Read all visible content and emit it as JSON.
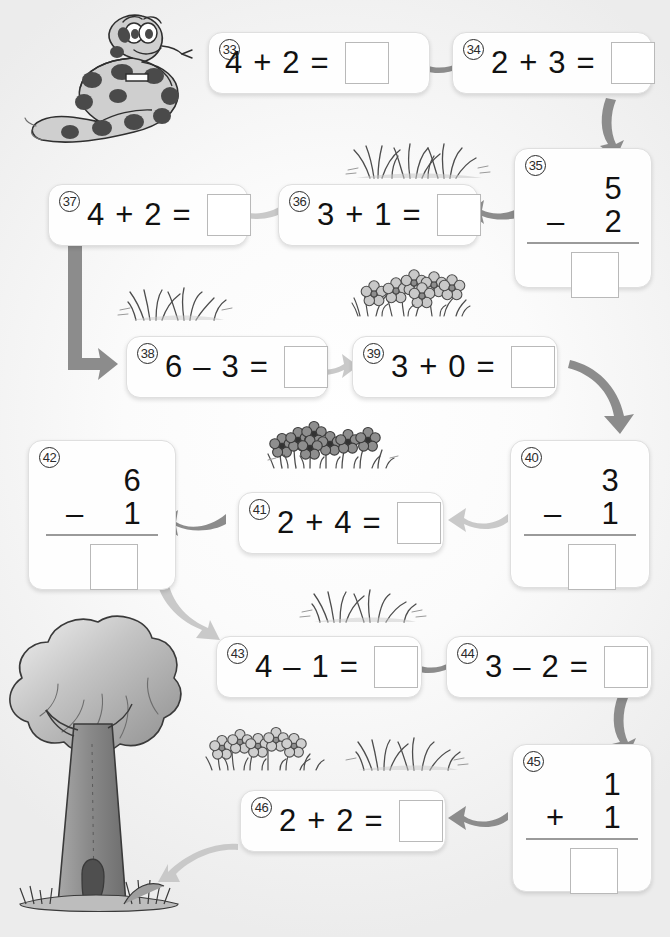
{
  "page": {
    "background_color": "#f4f4f4",
    "accent_color": "#8c8c8c"
  },
  "problems": [
    {
      "id": "33",
      "number": "33",
      "layout": "horizontal",
      "left": "4",
      "operator": "+",
      "right": "2",
      "equals": "=",
      "answer": ""
    },
    {
      "id": "34",
      "number": "34",
      "layout": "horizontal",
      "left": "2",
      "operator": "+",
      "right": "3",
      "equals": "=",
      "answer": ""
    },
    {
      "id": "35",
      "number": "35",
      "layout": "vertical",
      "top": "5",
      "operator": "–",
      "bottom": "2",
      "answer": ""
    },
    {
      "id": "36",
      "number": "36",
      "layout": "horizontal",
      "left": "3",
      "operator": "+",
      "right": "1",
      "equals": "=",
      "answer": ""
    },
    {
      "id": "37",
      "number": "37",
      "layout": "horizontal",
      "left": "4",
      "operator": "+",
      "right": "2",
      "equals": "=",
      "answer": ""
    },
    {
      "id": "38",
      "number": "38",
      "layout": "horizontal",
      "left": "6",
      "operator": "–",
      "right": "3",
      "equals": "=",
      "answer": ""
    },
    {
      "id": "39",
      "number": "39",
      "layout": "horizontal",
      "left": "3",
      "operator": "+",
      "right": "0",
      "equals": "=",
      "answer": ""
    },
    {
      "id": "40",
      "number": "40",
      "layout": "vertical",
      "top": "3",
      "operator": "–",
      "bottom": "1",
      "answer": ""
    },
    {
      "id": "41",
      "number": "41",
      "layout": "horizontal",
      "left": "2",
      "operator": "+",
      "right": "4",
      "equals": "=",
      "answer": ""
    },
    {
      "id": "42",
      "number": "42",
      "layout": "vertical",
      "top": "6",
      "operator": "–",
      "bottom": "1",
      "answer": ""
    },
    {
      "id": "43",
      "number": "43",
      "layout": "horizontal",
      "left": "4",
      "operator": "–",
      "right": "1",
      "equals": "=",
      "answer": ""
    },
    {
      "id": "44",
      "number": "44",
      "layout": "horizontal",
      "left": "3",
      "operator": "–",
      "right": "2",
      "equals": "=",
      "answer": ""
    },
    {
      "id": "45",
      "number": "45",
      "layout": "vertical",
      "top": "1",
      "operator": "+",
      "bottom": "1",
      "answer": ""
    },
    {
      "id": "46",
      "number": "46",
      "layout": "horizontal",
      "left": "2",
      "operator": "+",
      "right": "2",
      "equals": "=",
      "answer": ""
    }
  ],
  "decorations": [
    {
      "name": "snake-illustration",
      "kind": "snake"
    },
    {
      "name": "tree-illustration",
      "kind": "tree"
    },
    {
      "name": "grass-cluster-top",
      "kind": "grass"
    },
    {
      "name": "flower-cluster-upper",
      "kind": "flowers-light"
    },
    {
      "name": "grass-cluster-mid-left",
      "kind": "grass"
    },
    {
      "name": "flower-cluster-middle",
      "kind": "flowers-dark"
    },
    {
      "name": "grass-cluster-lower",
      "kind": "grass"
    },
    {
      "name": "flower-cluster-bottom",
      "kind": "flowers-light"
    },
    {
      "name": "grass-cluster-bottom-right",
      "kind": "grass"
    }
  ],
  "arrows": [
    {
      "name": "arrow-33-to-34",
      "from": "33",
      "to": "34",
      "direction": "right"
    },
    {
      "name": "arrow-34-to-35",
      "from": "34",
      "to": "35",
      "direction": "down"
    },
    {
      "name": "arrow-35-to-36",
      "from": "35",
      "to": "36",
      "direction": "left"
    },
    {
      "name": "arrow-36-to-37",
      "from": "36",
      "to": "37",
      "direction": "left"
    },
    {
      "name": "arrow-37-to-38",
      "from": "37",
      "to": "38",
      "direction": "down"
    },
    {
      "name": "arrow-38-to-39",
      "from": "38",
      "to": "39",
      "direction": "right"
    },
    {
      "name": "arrow-39-to-40",
      "from": "39",
      "to": "40",
      "direction": "down"
    },
    {
      "name": "arrow-40-to-41",
      "from": "40",
      "to": "41",
      "direction": "left"
    },
    {
      "name": "arrow-41-to-42",
      "from": "41",
      "to": "42",
      "direction": "left"
    },
    {
      "name": "arrow-42-to-43",
      "from": "42",
      "to": "43",
      "direction": "down"
    },
    {
      "name": "arrow-43-to-44",
      "from": "43",
      "to": "44",
      "direction": "right"
    },
    {
      "name": "arrow-44-to-45",
      "from": "44",
      "to": "45",
      "direction": "down"
    },
    {
      "name": "arrow-45-to-46",
      "from": "45",
      "to": "46",
      "direction": "left"
    },
    {
      "name": "arrow-46-to-tree",
      "from": "46",
      "to": "tree",
      "direction": "left"
    }
  ]
}
